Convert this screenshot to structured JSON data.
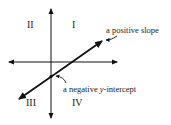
{
  "diagram": {
    "quadrants": {
      "q1": "I",
      "q2": "II",
      "q3": "III",
      "q4": "IV"
    },
    "annotations": {
      "slope": "a positive slope",
      "intercept_prefix": "a negative ",
      "intercept_var": "y",
      "intercept_suffix": "-intercept"
    },
    "colors": {
      "line": "#111111",
      "text": "#222222"
    }
  }
}
